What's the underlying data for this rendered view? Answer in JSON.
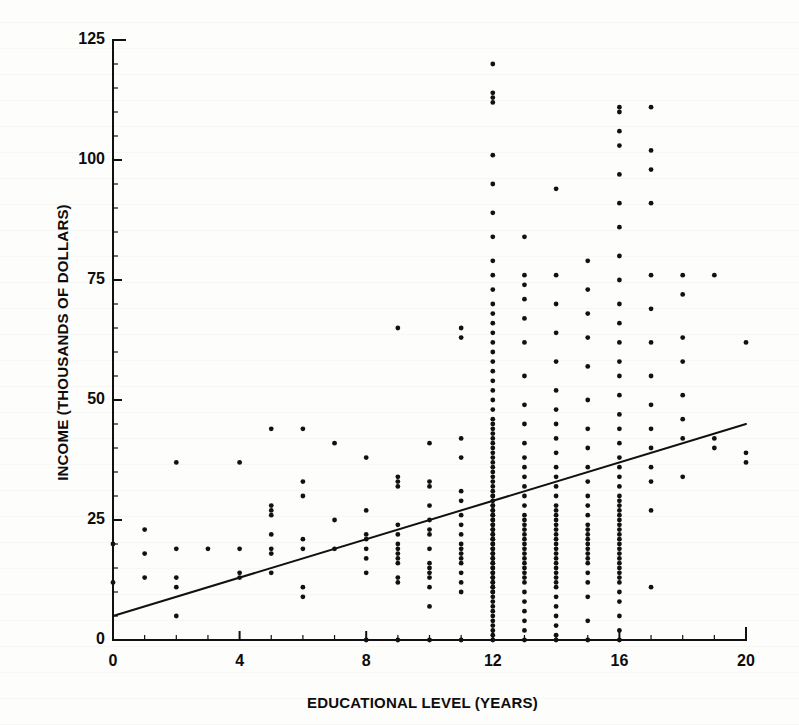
{
  "figure": {
    "background_color": "#fdfdfc",
    "ink_color": "#111111",
    "kind": "scanned-textbook-figure"
  },
  "chart_data": {
    "type": "scatter",
    "title": "",
    "subtitle": "",
    "xlabel": "EDUCATIONAL LEVEL (YEARS)",
    "ylabel": "INCOME (THOUSANDS OF DOLLARS)",
    "xlim": [
      0,
      20
    ],
    "ylim": [
      0,
      125
    ],
    "xticks": [
      0,
      4,
      8,
      12,
      16,
      20
    ],
    "xtick_labels": [
      "0",
      "4",
      "8",
      "12",
      "16",
      "20"
    ],
    "x_minor_tick_step": 1,
    "yticks": [
      0,
      25,
      50,
      75,
      100,
      125
    ],
    "ytick_labels": [
      "0",
      "25",
      "50",
      "75",
      "100",
      "125"
    ],
    "y_minor_tick_step": 5,
    "grid": false,
    "legend": null,
    "legend_position": "none",
    "marker": "filled-circle",
    "marker_size_px": 3,
    "marker_color": "#111111",
    "annotations": [],
    "trendline": {
      "name": "least-squares regression line",
      "x_start": 0,
      "y_start": 5,
      "x_end": 20,
      "y_end": 45,
      "slope": 2.0,
      "intercept": 5.0,
      "color": "#111111",
      "width_px": 2
    },
    "points": [
      [
        0,
        12
      ],
      [
        0,
        20
      ],
      [
        1,
        13
      ],
      [
        1,
        18
      ],
      [
        1,
        23
      ],
      [
        2,
        5
      ],
      [
        2,
        11
      ],
      [
        2,
        13
      ],
      [
        2,
        19
      ],
      [
        2,
        37
      ],
      [
        3,
        19
      ],
      [
        4,
        13
      ],
      [
        4,
        14
      ],
      [
        4,
        19
      ],
      [
        4,
        37
      ],
      [
        5,
        14
      ],
      [
        5,
        18
      ],
      [
        5,
        19
      ],
      [
        5,
        22
      ],
      [
        5,
        26
      ],
      [
        5,
        27
      ],
      [
        5,
        28
      ],
      [
        5,
        44
      ],
      [
        6,
        9
      ],
      [
        6,
        11
      ],
      [
        6,
        19
      ],
      [
        6,
        21
      ],
      [
        6,
        30
      ],
      [
        6,
        33
      ],
      [
        6,
        44
      ],
      [
        7,
        19
      ],
      [
        7,
        25
      ],
      [
        7,
        41
      ],
      [
        8,
        0
      ],
      [
        8,
        14
      ],
      [
        8,
        17
      ],
      [
        8,
        19
      ],
      [
        8,
        21
      ],
      [
        8,
        22
      ],
      [
        8,
        27
      ],
      [
        8,
        38
      ],
      [
        9,
        0
      ],
      [
        9,
        12
      ],
      [
        9,
        13
      ],
      [
        9,
        16
      ],
      [
        9,
        17
      ],
      [
        9,
        18
      ],
      [
        9,
        19
      ],
      [
        9,
        20
      ],
      [
        9,
        22
      ],
      [
        9,
        24
      ],
      [
        9,
        32
      ],
      [
        9,
        33
      ],
      [
        9,
        34
      ],
      [
        9,
        65
      ],
      [
        10,
        0
      ],
      [
        10,
        7
      ],
      [
        10,
        11
      ],
      [
        10,
        13
      ],
      [
        10,
        14
      ],
      [
        10,
        15
      ],
      [
        10,
        16
      ],
      [
        10,
        19
      ],
      [
        10,
        22
      ],
      [
        10,
        23
      ],
      [
        10,
        25
      ],
      [
        10,
        28
      ],
      [
        10,
        32
      ],
      [
        10,
        33
      ],
      [
        10,
        41
      ],
      [
        11,
        0
      ],
      [
        11,
        10
      ],
      [
        11,
        12
      ],
      [
        11,
        14
      ],
      [
        11,
        16
      ],
      [
        11,
        17
      ],
      [
        11,
        18
      ],
      [
        11,
        19
      ],
      [
        11,
        20
      ],
      [
        11,
        22
      ],
      [
        11,
        24
      ],
      [
        11,
        26
      ],
      [
        11,
        29
      ],
      [
        11,
        31
      ],
      [
        11,
        38
      ],
      [
        11,
        42
      ],
      [
        11,
        63
      ],
      [
        11,
        65
      ],
      [
        12,
        0
      ],
      [
        12,
        1
      ],
      [
        12,
        2
      ],
      [
        12,
        3
      ],
      [
        12,
        4
      ],
      [
        12,
        5
      ],
      [
        12,
        6
      ],
      [
        12,
        7
      ],
      [
        12,
        8
      ],
      [
        12,
        9
      ],
      [
        12,
        10
      ],
      [
        12,
        10
      ],
      [
        12,
        11
      ],
      [
        12,
        11
      ],
      [
        12,
        12
      ],
      [
        12,
        12
      ],
      [
        12,
        13
      ],
      [
        12,
        13
      ],
      [
        12,
        14
      ],
      [
        12,
        14
      ],
      [
        12,
        15
      ],
      [
        12,
        15
      ],
      [
        12,
        16
      ],
      [
        12,
        16
      ],
      [
        12,
        17
      ],
      [
        12,
        17
      ],
      [
        12,
        18
      ],
      [
        12,
        18
      ],
      [
        12,
        19
      ],
      [
        12,
        19
      ],
      [
        12,
        20
      ],
      [
        12,
        20
      ],
      [
        12,
        21
      ],
      [
        12,
        21
      ],
      [
        12,
        22
      ],
      [
        12,
        22
      ],
      [
        12,
        23
      ],
      [
        12,
        23
      ],
      [
        12,
        24
      ],
      [
        12,
        24
      ],
      [
        12,
        25
      ],
      [
        12,
        25
      ],
      [
        12,
        26
      ],
      [
        12,
        26
      ],
      [
        12,
        27
      ],
      [
        12,
        27
      ],
      [
        12,
        28
      ],
      [
        12,
        28
      ],
      [
        12,
        29
      ],
      [
        12,
        30
      ],
      [
        12,
        30
      ],
      [
        12,
        31
      ],
      [
        12,
        32
      ],
      [
        12,
        33
      ],
      [
        12,
        34
      ],
      [
        12,
        35
      ],
      [
        12,
        36
      ],
      [
        12,
        37
      ],
      [
        12,
        38
      ],
      [
        12,
        39
      ],
      [
        12,
        40
      ],
      [
        12,
        41
      ],
      [
        12,
        42
      ],
      [
        12,
        43
      ],
      [
        12,
        44
      ],
      [
        12,
        45
      ],
      [
        12,
        46
      ],
      [
        12,
        48
      ],
      [
        12,
        50
      ],
      [
        12,
        52
      ],
      [
        12,
        54
      ],
      [
        12,
        56
      ],
      [
        12,
        58
      ],
      [
        12,
        60
      ],
      [
        12,
        62
      ],
      [
        12,
        64
      ],
      [
        12,
        66
      ],
      [
        12,
        68
      ],
      [
        12,
        70
      ],
      [
        12,
        73
      ],
      [
        12,
        76
      ],
      [
        12,
        79
      ],
      [
        12,
        84
      ],
      [
        12,
        89
      ],
      [
        12,
        95
      ],
      [
        12,
        101
      ],
      [
        12,
        112
      ],
      [
        12,
        113
      ],
      [
        12,
        114
      ],
      [
        12,
        120
      ],
      [
        13,
        0
      ],
      [
        13,
        2
      ],
      [
        13,
        4
      ],
      [
        13,
        6
      ],
      [
        13,
        8
      ],
      [
        13,
        10
      ],
      [
        13,
        12
      ],
      [
        13,
        13
      ],
      [
        13,
        14
      ],
      [
        13,
        15
      ],
      [
        13,
        16
      ],
      [
        13,
        17
      ],
      [
        13,
        18
      ],
      [
        13,
        19
      ],
      [
        13,
        20
      ],
      [
        13,
        21
      ],
      [
        13,
        22
      ],
      [
        13,
        23
      ],
      [
        13,
        24
      ],
      [
        13,
        25
      ],
      [
        13,
        26
      ],
      [
        13,
        28
      ],
      [
        13,
        30
      ],
      [
        13,
        32
      ],
      [
        13,
        34
      ],
      [
        13,
        36
      ],
      [
        13,
        38
      ],
      [
        13,
        41
      ],
      [
        13,
        45
      ],
      [
        13,
        49
      ],
      [
        13,
        55
      ],
      [
        13,
        62
      ],
      [
        13,
        67
      ],
      [
        13,
        71
      ],
      [
        13,
        74
      ],
      [
        13,
        76
      ],
      [
        13,
        84
      ],
      [
        14,
        0
      ],
      [
        14,
        1
      ],
      [
        14,
        3
      ],
      [
        14,
        5
      ],
      [
        14,
        7
      ],
      [
        14,
        9
      ],
      [
        14,
        11
      ],
      [
        14,
        12
      ],
      [
        14,
        13
      ],
      [
        14,
        14
      ],
      [
        14,
        15
      ],
      [
        14,
        16
      ],
      [
        14,
        17
      ],
      [
        14,
        18
      ],
      [
        14,
        19
      ],
      [
        14,
        20
      ],
      [
        14,
        21
      ],
      [
        14,
        22
      ],
      [
        14,
        23
      ],
      [
        14,
        24
      ],
      [
        14,
        25
      ],
      [
        14,
        26
      ],
      [
        14,
        27
      ],
      [
        14,
        28
      ],
      [
        14,
        30
      ],
      [
        14,
        32
      ],
      [
        14,
        34
      ],
      [
        14,
        36
      ],
      [
        14,
        39
      ],
      [
        14,
        42
      ],
      [
        14,
        45
      ],
      [
        14,
        48
      ],
      [
        14,
        52
      ],
      [
        14,
        58
      ],
      [
        14,
        64
      ],
      [
        14,
        70
      ],
      [
        14,
        76
      ],
      [
        14,
        94
      ],
      [
        15,
        0
      ],
      [
        15,
        4
      ],
      [
        15,
        9
      ],
      [
        15,
        12
      ],
      [
        15,
        14
      ],
      [
        15,
        16
      ],
      [
        15,
        17
      ],
      [
        15,
        18
      ],
      [
        15,
        19
      ],
      [
        15,
        20
      ],
      [
        15,
        21
      ],
      [
        15,
        22
      ],
      [
        15,
        23
      ],
      [
        15,
        24
      ],
      [
        15,
        26
      ],
      [
        15,
        28
      ],
      [
        15,
        30
      ],
      [
        15,
        33
      ],
      [
        15,
        36
      ],
      [
        15,
        40
      ],
      [
        15,
        44
      ],
      [
        15,
        50
      ],
      [
        15,
        57
      ],
      [
        15,
        63
      ],
      [
        15,
        68
      ],
      [
        15,
        73
      ],
      [
        15,
        79
      ],
      [
        16,
        0
      ],
      [
        16,
        2
      ],
      [
        16,
        5
      ],
      [
        16,
        8
      ],
      [
        16,
        10
      ],
      [
        16,
        12
      ],
      [
        16,
        13
      ],
      [
        16,
        14
      ],
      [
        16,
        15
      ],
      [
        16,
        16
      ],
      [
        16,
        17
      ],
      [
        16,
        18
      ],
      [
        16,
        19
      ],
      [
        16,
        20
      ],
      [
        16,
        21
      ],
      [
        16,
        22
      ],
      [
        16,
        23
      ],
      [
        16,
        24
      ],
      [
        16,
        25
      ],
      [
        16,
        26
      ],
      [
        16,
        27
      ],
      [
        16,
        28
      ],
      [
        16,
        29
      ],
      [
        16,
        30
      ],
      [
        16,
        32
      ],
      [
        16,
        34
      ],
      [
        16,
        36
      ],
      [
        16,
        38
      ],
      [
        16,
        41
      ],
      [
        16,
        44
      ],
      [
        16,
        47
      ],
      [
        16,
        51
      ],
      [
        16,
        55
      ],
      [
        16,
        58
      ],
      [
        16,
        62
      ],
      [
        16,
        66
      ],
      [
        16,
        70
      ],
      [
        16,
        75
      ],
      [
        16,
        80
      ],
      [
        16,
        86
      ],
      [
        16,
        91
      ],
      [
        16,
        97
      ],
      [
        16,
        103
      ],
      [
        16,
        106
      ],
      [
        16,
        110
      ],
      [
        16,
        111
      ],
      [
        17,
        11
      ],
      [
        17,
        27
      ],
      [
        17,
        33
      ],
      [
        17,
        36
      ],
      [
        17,
        40
      ],
      [
        17,
        44
      ],
      [
        17,
        49
      ],
      [
        17,
        55
      ],
      [
        17,
        62
      ],
      [
        17,
        69
      ],
      [
        17,
        76
      ],
      [
        17,
        91
      ],
      [
        17,
        98
      ],
      [
        17,
        102
      ],
      [
        17,
        111
      ],
      [
        18,
        34
      ],
      [
        18,
        42
      ],
      [
        18,
        46
      ],
      [
        18,
        51
      ],
      [
        18,
        58
      ],
      [
        18,
        63
      ],
      [
        18,
        72
      ],
      [
        18,
        76
      ],
      [
        19,
        40
      ],
      [
        19,
        42
      ],
      [
        19,
        76
      ],
      [
        20,
        37
      ],
      [
        20,
        39
      ],
      [
        20,
        62
      ]
    ]
  }
}
